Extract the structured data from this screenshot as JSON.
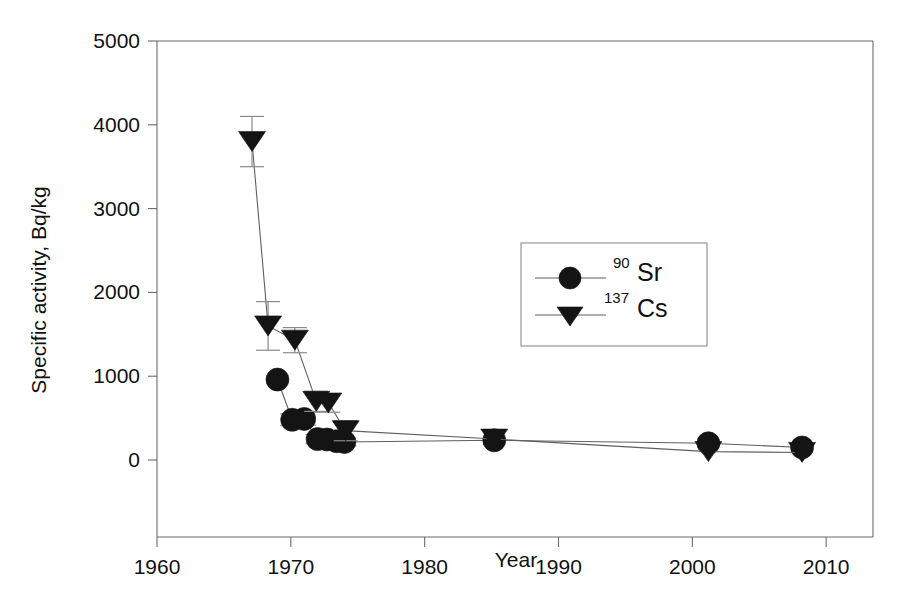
{
  "chart_data": {
    "type": "scatter",
    "title": "",
    "xlabel": "Year",
    "ylabel": "Specific activity, Bq/kg",
    "xlim": [
      1960,
      2013.5
    ],
    "ylim": [
      -580,
      5000
    ],
    "grid": false,
    "legend_position": "center-right-upper",
    "xticks": [
      1960,
      1970,
      1980,
      1990,
      2000,
      2010
    ],
    "xtick_labels": [
      "1960",
      "1970",
      "1980",
      "1990",
      "2000",
      "2010"
    ],
    "yticks": [
      0,
      1000,
      2000,
      3000,
      4000,
      5000
    ],
    "ytick_labels": [
      "0",
      "1000",
      "2000",
      "3000",
      "4000",
      "5000"
    ],
    "series": [
      {
        "name": "Sr-90",
        "legend_sup": "90",
        "legend_base": "Sr",
        "marker": "circle",
        "x": [
          1969.0,
          1970.1,
          1971.0,
          1972.0,
          1972.7,
          1973.4,
          1974.0,
          1985.2,
          2001.2,
          2008.2
        ],
        "values": [
          960,
          480,
          490,
          250,
          245,
          225,
          215,
          235,
          200,
          150
        ],
        "yerr": [
          0,
          70,
          75,
          55,
          50,
          45,
          45,
          0,
          0,
          0
        ]
      },
      {
        "name": "Cs-137",
        "legend_sup": "137",
        "legend_base": "Cs",
        "marker": "triangle-down",
        "x": [
          1967.1,
          1968.3,
          1970.3,
          1971.9,
          1972.8,
          1974.1,
          1985.2,
          2001.2,
          2008.2
        ],
        "values": [
          3800,
          1600,
          1430,
          700,
          680,
          350,
          250,
          100,
          90
        ],
        "yerr": [
          300,
          290,
          150,
          120,
          110,
          120,
          0,
          0,
          0
        ]
      }
    ]
  }
}
